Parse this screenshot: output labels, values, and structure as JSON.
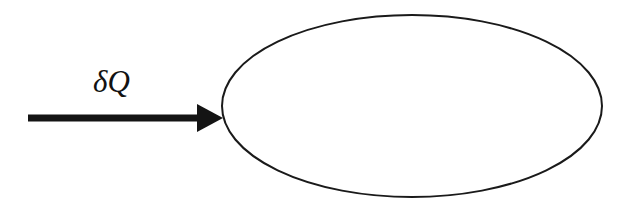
{
  "figure": {
    "title": "",
    "background_color": "#ffffff",
    "ink_color": "#141414",
    "width": 627,
    "height": 220
  },
  "system_boundary": {
    "shape_name": "ellipse",
    "label": "",
    "stroke_color": "#1a1a1a",
    "fill_color": "#ffffff",
    "stroke_width": 2,
    "center_x": 412,
    "center_y": 106,
    "radius_x": 190,
    "radius_y": 91
  },
  "heat_arrow": {
    "label": "δQ",
    "label_plain": "delta Q",
    "direction": "right",
    "meaning": "heat-input",
    "color": "#141414",
    "shaft_start_x": 28,
    "shaft_end_x": 200,
    "shaft_center_y": 118,
    "shaft_thickness": 7,
    "head_tip_x": 223,
    "head_half_height": 14
  }
}
